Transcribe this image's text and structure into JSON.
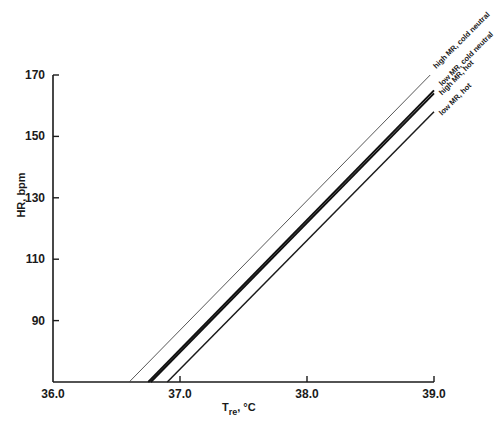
{
  "chart_data": {
    "type": "line",
    "title": "",
    "xlabel": "T",
    "xlabel_sub": "re",
    "xlabel_unit": ", °C",
    "ylabel": "HR, bpm",
    "xlim": [
      36.0,
      39.0
    ],
    "ylim": [
      70,
      170
    ],
    "xticks": [
      36.0,
      37.0,
      38.0,
      39.0
    ],
    "xtick_labels": [
      "36.0",
      "37.0",
      "38.0",
      "39.0"
    ],
    "yticks": [
      90,
      110,
      130,
      150,
      170
    ],
    "ytick_labels": [
      "90",
      "110",
      "130",
      "150",
      "170"
    ],
    "grid": false,
    "legend": "inline labels at line ends (top-right)",
    "series": [
      {
        "name": "high MR, cold neutral",
        "x": [
          36.6,
          38.97
        ],
        "y": [
          70,
          170
        ],
        "weight": "thin"
      },
      {
        "name": "low MR, cold neutral",
        "x": [
          36.75,
          39.0
        ],
        "y": [
          70,
          165
        ],
        "weight": "bold"
      },
      {
        "name": "high MR, hot",
        "x": [
          36.77,
          39.0
        ],
        "y": [
          70,
          164
        ],
        "weight": "bold"
      },
      {
        "name": "low MR, hot",
        "x": [
          36.9,
          39.0
        ],
        "y": [
          70,
          158
        ],
        "weight": "medium"
      }
    ]
  }
}
